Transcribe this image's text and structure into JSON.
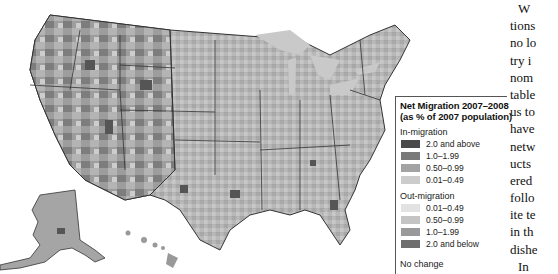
{
  "map": {
    "title": "Net Migration 2007–2008",
    "subtitle": "(as % of 2007 population)",
    "regions_shown": [
      "Contiguous United States (counties)",
      "Alaska",
      "Hawaii"
    ],
    "shading": "grayscale choropleth by county"
  },
  "legend": {
    "title": "Net Migration 2007–2008",
    "subtitle": "(as % of 2007 population)",
    "in_migration": {
      "label": "In-migration",
      "items": [
        {
          "label": "2.0 and above",
          "color": "#4a4a4a"
        },
        {
          "label": "1.0–1.99",
          "color": "#7a7a7a"
        },
        {
          "label": "0.50–0.99",
          "color": "#a3a3a3"
        },
        {
          "label": "0.01–0.49",
          "color": "#cccccc"
        }
      ]
    },
    "out_migration": {
      "label": "Out-migration",
      "items": [
        {
          "label": "0.01–0.49",
          "color": "#e2e2e2"
        },
        {
          "label": "0.50–0.99",
          "color": "#c4c4c4"
        },
        {
          "label": "1.0–1.99",
          "color": "#9a9a9a"
        },
        {
          "label": "2.0 and below",
          "color": "#6e6e6e"
        }
      ]
    },
    "no_change": {
      "label": "No change"
    }
  },
  "body_text": {
    "lines": [
      "W",
      "tions",
      "no lo",
      "try i",
      "nom",
      "table",
      "us to",
      "have",
      "netw",
      "ucts",
      "ered",
      "follo",
      "ite te",
      "in th",
      "dishe",
      "In"
    ]
  }
}
